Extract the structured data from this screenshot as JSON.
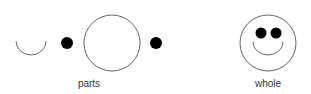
{
  "diagram": {
    "groups": [
      {
        "label": "parts",
        "elements": [
          "mouth-arc",
          "dot",
          "circle-outline",
          "dot"
        ]
      },
      {
        "label": "whole",
        "elements": [
          "smiley-face"
        ]
      }
    ],
    "colors": {
      "stroke": "#555555",
      "fill": "#000000",
      "text": "#333333",
      "background": "#ffffff"
    }
  }
}
